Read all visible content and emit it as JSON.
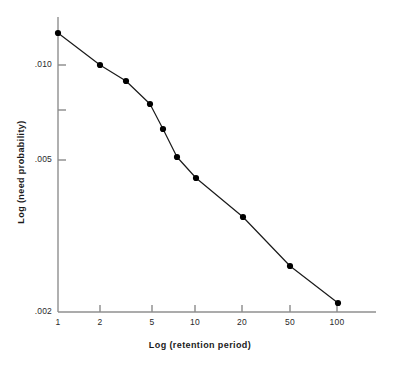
{
  "figure": {
    "background": "#ffffff",
    "line_color": "#1a1a1a",
    "marker_color": "#000000",
    "axis_color": "#8a8a8a"
  },
  "axes": {
    "x_title": "Log (retention  period)",
    "y_title": "Log  (need  probability)",
    "x_ticks": [
      {
        "label": "1",
        "value": 1,
        "px": 58
      },
      {
        "label": "2",
        "value": 2,
        "px": 100
      },
      {
        "label": "5",
        "value": 5,
        "px": 152
      },
      {
        "label": "10",
        "value": 10,
        "px": 195
      },
      {
        "label": "20",
        "value": 20,
        "px": 242
      },
      {
        "label": "50",
        "value": 50,
        "px": 290
      },
      {
        "label": "100",
        "value": 100,
        "px": 337
      }
    ],
    "y_ticks": [
      {
        "label": ".010",
        "value": 0.01,
        "px": 65
      },
      {
        "label": "",
        "value": 0.0075,
        "px": 110
      },
      {
        "label": ".005",
        "value": 0.005,
        "px": 160
      },
      {
        "label": ".002",
        "value": 0.002,
        "px": 312
      }
    ]
  },
  "chart_data": {
    "type": "line",
    "title": "",
    "xlabel": "Log (retention  period)",
    "ylabel": "Log  (need  probability)",
    "xscale": "log",
    "yscale": "log",
    "xlim": [
      1,
      100
    ],
    "ylim": [
      0.002,
      0.0125
    ],
    "grid": false,
    "legend": "none",
    "marker": "filled-circle",
    "series": [
      {
        "name": "need probability",
        "x": [
          1,
          2,
          3,
          4.7,
          6,
          8,
          10,
          20,
          50,
          100
        ],
        "y": [
          0.0117,
          0.0102,
          0.0094,
          0.0081,
          0.0069,
          0.0056,
          0.0048,
          0.0032,
          0.0024,
          0.0021
        ],
        "points_px": [
          {
            "x": 58,
            "y": 33
          },
          {
            "x": 100,
            "y": 65
          },
          {
            "x": 126,
            "y": 81
          },
          {
            "x": 150,
            "y": 104
          },
          {
            "x": 163,
            "y": 129
          },
          {
            "x": 177,
            "y": 157
          },
          {
            "x": 196,
            "y": 178
          },
          {
            "x": 243,
            "y": 217
          },
          {
            "x": 290,
            "y": 266
          },
          {
            "x": 338,
            "y": 303
          }
        ]
      }
    ]
  }
}
